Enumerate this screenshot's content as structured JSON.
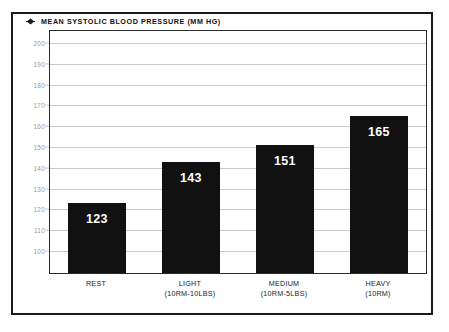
{
  "chart_data": {
    "type": "bar",
    "title": "MEAN SYSTOLIC BLOOD PRESSURE (MM HG)",
    "title_marker_icon": "diamond-marker-icon",
    "xlabel": "",
    "ylabel": "",
    "ylim": [
      100,
      200
    ],
    "ytick_step": 10,
    "yticks": [
      "200",
      "190",
      "180",
      "170",
      "160",
      "150",
      "140",
      "130",
      "120",
      "110",
      "100"
    ],
    "ytick_values": [
      200,
      190,
      180,
      170,
      160,
      150,
      140,
      130,
      120,
      110,
      100
    ],
    "grid": true,
    "legend": false,
    "bar_color": "#111111",
    "value_label_color": "#ffffff",
    "gridline_color": "#c9c9c9",
    "categories": [
      "REST",
      "LIGHT",
      "MEDIUM",
      "HEAVY"
    ],
    "category_sublabels": [
      "",
      "(10RM-10LBS)",
      "(10RM-5LBS)",
      "(10RM)"
    ],
    "values": [
      123,
      143,
      151,
      165
    ],
    "bars": [
      {
        "category": "REST",
        "sublabel": "",
        "value": 123,
        "label": "123"
      },
      {
        "category": "LIGHT",
        "sublabel": "(10RM-10LBS)",
        "value": 143,
        "label": "143"
      },
      {
        "category": "MEDIUM",
        "sublabel": "(10RM-5LBS)",
        "value": 151,
        "label": "151"
      },
      {
        "category": "HEAVY",
        "sublabel": "(10RM)",
        "value": 165,
        "label": "165"
      }
    ]
  }
}
